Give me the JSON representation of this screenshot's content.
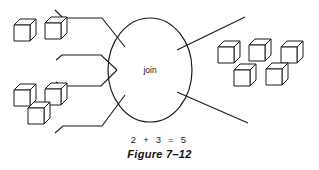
{
  "figure": {
    "caption": "Figure 7–12",
    "equation": "2 + 3 = 5",
    "center_label": "join",
    "background_color": "#ffffff",
    "line_color": "#1a1a1a"
  },
  "diagram": {
    "type": "join-operation-flow",
    "input_group_top": {
      "name": "top-left-cube-group",
      "count": 2,
      "cubes": [
        {
          "x": 14,
          "y": 25
        },
        {
          "x": 45,
          "y": 23
        }
      ]
    },
    "input_group_bottom": {
      "name": "bottom-left-cube-group",
      "count": 3,
      "cubes": [
        {
          "x": 14,
          "y": 90
        },
        {
          "x": 45,
          "y": 89
        },
        {
          "x": 28,
          "y": 108
        }
      ]
    },
    "output_group": {
      "name": "right-cube-group",
      "count": 5,
      "cubes": [
        {
          "x": 218,
          "y": 47
        },
        {
          "x": 249,
          "y": 45
        },
        {
          "x": 281,
          "y": 47
        },
        {
          "x": 234,
          "y": 70
        },
        {
          "x": 266,
          "y": 69
        }
      ]
    },
    "center_node": {
      "name": "join-ellipse",
      "cx": 150,
      "cy": 70,
      "rx": 42,
      "ry": 52
    },
    "connectors": [
      {
        "name": "top-input-connector",
        "points": "55,10 63,18 102,18 125,47"
      },
      {
        "name": "middle-input-funnel-upper",
        "points": "56,60 62,55 101,55 117,70"
      },
      {
        "name": "middle-input-funnel-lower",
        "points": "117,70 101,86 62,86 56,82"
      },
      {
        "name": "bottom-input-connector",
        "points": "55,133 63,126 102,126 125,95"
      },
      {
        "name": "top-output-connector",
        "points": "177,50 245,17"
      },
      {
        "name": "bottom-output-connector",
        "points": "177,92 248,123"
      }
    ]
  },
  "cube_style": {
    "size": 16,
    "depth_x": 6,
    "depth_y": 6
  }
}
